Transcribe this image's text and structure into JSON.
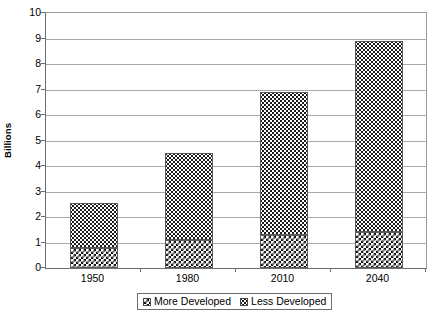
{
  "chart_data": {
    "type": "bar",
    "subtype": "stacked-vertical",
    "title": "",
    "xlabel": "",
    "ylabel": "Billions",
    "ylim": [
      0,
      10
    ],
    "ytick_interval": 1,
    "yticks": [
      "10",
      "9",
      "8",
      "7",
      "6",
      "5",
      "4",
      "3",
      "2",
      "1",
      "0"
    ],
    "grid": "horizontal",
    "categories": [
      "1950",
      "1980",
      "2010",
      "2040"
    ],
    "series": [
      {
        "name": "More Developed",
        "pattern": "dense-checkerboard",
        "color": "#1a1a1a",
        "values": [
          0.8,
          1.1,
          1.3,
          1.4
        ]
      },
      {
        "name": "Less Developed",
        "pattern": "sparse-dots",
        "color": "#e8e8e8",
        "values": [
          1.75,
          3.4,
          5.6,
          7.5
        ]
      }
    ],
    "totals": [
      2.55,
      4.5,
      6.9,
      8.9
    ],
    "legend_position": "bottom-center",
    "legend_entries": [
      "More Developed",
      "Less Developed"
    ]
  },
  "axis": {
    "y_title": "Billions"
  }
}
